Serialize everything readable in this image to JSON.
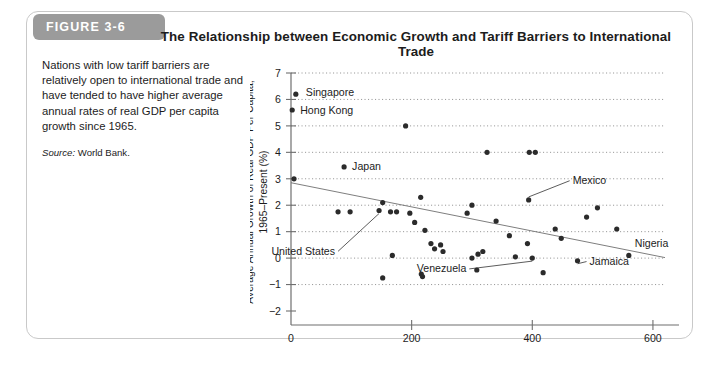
{
  "figure": {
    "tab_label": "FIGURE 3-6",
    "title": "The Relationship between Economic Growth and Tariff Barriers to International Trade"
  },
  "caption": {
    "body": "Nations with low tariff barriers are relatively open to international trade and have tended to have higher average annual rates of real GDP per capita growth since 1965.",
    "source_word": "Source:",
    "source_value": " World Bank."
  },
  "chart_data": {
    "type": "scatter",
    "title": "The Relationship between Economic Growth and Tariff Barriers to International Trade",
    "xlabel": "Tariff Barrier Index (United States = 100)",
    "ylabel": "Average Annual Growth of Real GDP Per Capita, 1965–Present (%)",
    "xlim": [
      0,
      620
    ],
    "ylim": [
      -2,
      7
    ],
    "xticks": [
      0,
      200,
      400,
      600
    ],
    "xticklabels": [
      "0",
      "200",
      "400",
      "600"
    ],
    "yticks": [
      -2,
      -1,
      0,
      1,
      2,
      3,
      4,
      5,
      6,
      7
    ],
    "yticklabels": [
      "−2",
      "−1",
      "0",
      "1",
      "2",
      "3",
      "4",
      "5",
      "6",
      "7"
    ],
    "grid": "horizontal-dotted",
    "legend": "none",
    "series": [
      {
        "name": "Countries",
        "points": [
          {
            "x": 8,
            "y": 6.2,
            "label": "Singapore",
            "label_dx": 10,
            "label_dy": 2,
            "leader": false
          },
          {
            "x": 2,
            "y": 5.6,
            "label": "Hong Kong",
            "label_dx": 8,
            "label_dy": 4,
            "leader": false
          },
          {
            "x": 5,
            "y": 3.0,
            "label": "Norway",
            "label_dx": -48,
            "label_dy": -5,
            "leader": false
          },
          {
            "x": 88,
            "y": 3.45,
            "label": "Japan",
            "label_dx": 8,
            "label_dy": 3,
            "leader": false
          },
          {
            "x": 146,
            "y": 1.8,
            "label": "United States",
            "label_dx": -44,
            "label_dy": 44,
            "leader": true
          },
          {
            "x": 394,
            "y": 2.2,
            "label": "Mexico",
            "label_dx": 44,
            "label_dy": -16,
            "leader": true
          },
          {
            "x": 400,
            "y": 0.0,
            "label": "Venezuela",
            "label_dx": -66,
            "label_dy": 14,
            "leader": true
          },
          {
            "x": 475,
            "y": -0.1,
            "label": "Jamaica",
            "label_dx": 12,
            "label_dy": 4,
            "leader": true
          },
          {
            "x": 560,
            "y": 0.1,
            "label": "Nigeria",
            "label_dx": 6,
            "label_dy": -8,
            "leader": false
          },
          {
            "x": 190,
            "y": 5.0
          },
          {
            "x": 325,
            "y": 4.0
          },
          {
            "x": 395,
            "y": 4.0
          },
          {
            "x": 405,
            "y": 4.0
          },
          {
            "x": 78,
            "y": 1.75
          },
          {
            "x": 98,
            "y": 1.75
          },
          {
            "x": 152,
            "y": 2.1
          },
          {
            "x": 165,
            "y": 1.75
          },
          {
            "x": 175,
            "y": 1.75
          },
          {
            "x": 197,
            "y": 1.7
          },
          {
            "x": 205,
            "y": 1.35
          },
          {
            "x": 215,
            "y": 2.3
          },
          {
            "x": 222,
            "y": 1.05
          },
          {
            "x": 232,
            "y": 0.55
          },
          {
            "x": 238,
            "y": 0.35
          },
          {
            "x": 248,
            "y": 0.5
          },
          {
            "x": 252,
            "y": 0.25
          },
          {
            "x": 168,
            "y": 0.1
          },
          {
            "x": 152,
            "y": -0.75
          },
          {
            "x": 216,
            "y": -0.6
          },
          {
            "x": 218,
            "y": -0.7
          },
          {
            "x": 292,
            "y": 1.7
          },
          {
            "x": 300,
            "y": 2.0
          },
          {
            "x": 310,
            "y": 0.15
          },
          {
            "x": 318,
            "y": 0.25
          },
          {
            "x": 300,
            "y": 0.0
          },
          {
            "x": 308,
            "y": -0.45
          },
          {
            "x": 340,
            "y": 1.4
          },
          {
            "x": 362,
            "y": 0.85
          },
          {
            "x": 372,
            "y": 0.05
          },
          {
            "x": 392,
            "y": 0.55
          },
          {
            "x": 418,
            "y": -0.55
          },
          {
            "x": 438,
            "y": 1.1
          },
          {
            "x": 448,
            "y": 0.75
          },
          {
            "x": 490,
            "y": 1.55
          },
          {
            "x": 540,
            "y": 1.1
          },
          {
            "x": 508,
            "y": 1.9
          }
        ]
      }
    ],
    "trendline": {
      "x0": 0,
      "y0": 2.85,
      "x1": 620,
      "y1": 0.02
    }
  }
}
